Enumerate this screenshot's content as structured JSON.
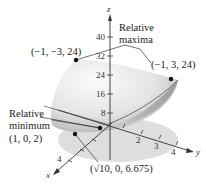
{
  "figure": {
    "type": "3d-surface",
    "axes": {
      "z": {
        "name": "z",
        "ticks": [
          "8",
          "16",
          "24",
          "32",
          "40"
        ]
      },
      "y": {
        "name": "y",
        "ticks": [
          "2",
          "3",
          "4"
        ]
      },
      "x": {
        "name": "x",
        "ticks": [
          "4"
        ]
      }
    },
    "annotations": {
      "maxima_label_line1": "Relative",
      "maxima_label_line2": "maxima",
      "max_point_left": "(−1, −3, 24)",
      "max_point_right": "(−1, 3, 24)",
      "minimum_label_line1": "Relative",
      "minimum_label_line2": "minimum",
      "min_point": "(1, 0, 2)",
      "boundary_point": "(√10, 0, 6.675)"
    },
    "points": [
      {
        "label": "(-1, -3, 24)",
        "kind": "relative maximum"
      },
      {
        "label": "(-1, 3, 24)",
        "kind": "relative maximum"
      },
      {
        "label": "(1, 0, 2)",
        "kind": "relative minimum"
      },
      {
        "label": "(sqrt(10), 0, 6.675)",
        "kind": "boundary point"
      }
    ],
    "colors": {
      "surface_light": "#f2f2f2",
      "surface_dark": "#b8b8b8",
      "shadow": "#dcdcdc",
      "ink": "#222222"
    }
  }
}
